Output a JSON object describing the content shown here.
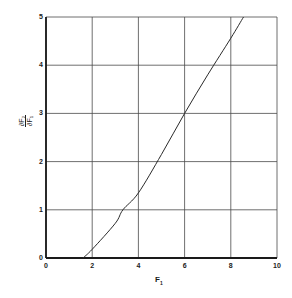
{
  "chart_data": {
    "type": "line",
    "title": "",
    "xlabel": "F1",
    "ylabel": "∂F2/∂F1",
    "xlim": [
      0,
      10
    ],
    "ylim": [
      0,
      5
    ],
    "grid": true,
    "legend": null,
    "x_ticks": [
      "0",
      "2",
      "4",
      "6",
      "8",
      "10"
    ],
    "y_ticks": [
      "0",
      "1",
      "2",
      "3",
      "4",
      "5"
    ],
    "series": [
      {
        "name": "curve",
        "x": [
          1.6,
          2.0,
          3.0,
          3.33,
          4.0,
          5.0,
          6.0,
          7.0,
          8.0,
          8.55
        ],
        "y": [
          0.0,
          0.18,
          0.72,
          1.0,
          1.35,
          2.15,
          3.0,
          3.8,
          4.56,
          5.0
        ]
      }
    ]
  },
  "labels": {
    "x_main": "F",
    "x_sub": "1",
    "y_num": "∂F₂",
    "y_den": "∂F₁"
  },
  "colors": {
    "line": "#2a2a2a",
    "grid": "#4a4a4a",
    "axis": "#1a1a1a",
    "background": "#ffffff"
  }
}
